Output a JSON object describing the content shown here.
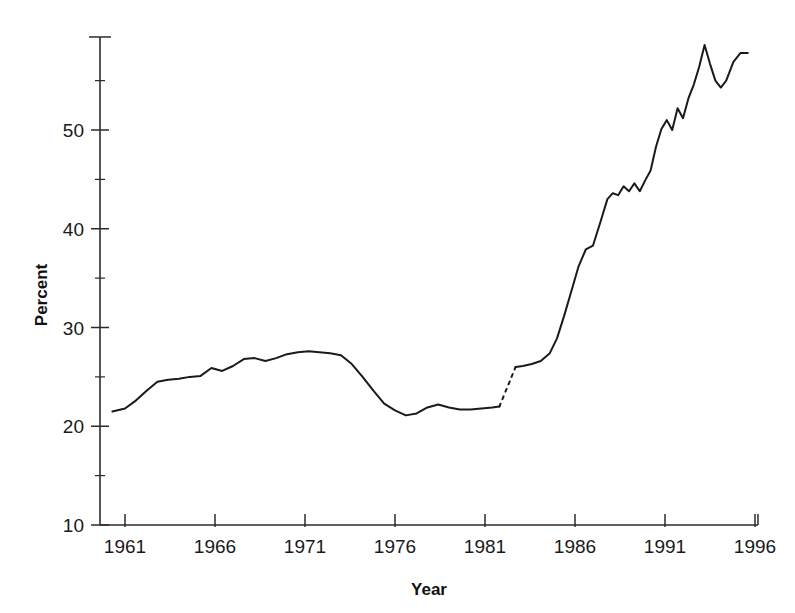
{
  "chart_data": {
    "type": "line",
    "title": "",
    "xlabel": "Year",
    "ylabel": "Percent",
    "xlim": [
      1960,
      1996
    ],
    "ylim": [
      10,
      60
    ],
    "grid": false,
    "legend": null,
    "x_ticks": [
      1961,
      1966,
      1971,
      1976,
      1981,
      1986,
      1991,
      1996
    ],
    "x_tick_labels": [
      "1961",
      "1966",
      "1971",
      "1976",
      "1981",
      "1986",
      "1991",
      "1996"
    ],
    "y_ticks": [
      10,
      20,
      30,
      40,
      50
    ],
    "y_tick_labels": [
      "10",
      "20",
      "30",
      "40",
      "50"
    ],
    "y_minor_ticks": [
      15,
      25,
      35,
      45,
      55
    ],
    "series": [
      {
        "name": "Percent",
        "style": "solid",
        "note": "segment before data break",
        "x": [
          1960.3,
          1961.0,
          1961.6,
          1962.2,
          1962.8,
          1963.4,
          1964.0,
          1964.6,
          1965.2,
          1965.8,
          1966.4,
          1967.0,
          1967.6,
          1968.2,
          1968.8,
          1969.4,
          1970.0,
          1970.6,
          1971.2,
          1971.8,
          1972.4,
          1973.0,
          1973.6,
          1974.2,
          1974.8,
          1975.4,
          1976.0,
          1976.6,
          1977.2,
          1977.8,
          1978.4,
          1979.0,
          1979.6,
          1980.2,
          1980.8,
          1981.4,
          1981.8
        ],
        "y": [
          21.5,
          21.8,
          22.6,
          23.6,
          24.5,
          24.7,
          24.8,
          25.0,
          25.1,
          25.9,
          25.6,
          26.1,
          26.8,
          26.9,
          26.6,
          26.9,
          27.3,
          27.5,
          27.6,
          27.5,
          27.4,
          27.2,
          26.3,
          25.0,
          23.6,
          22.3,
          21.6,
          21.1,
          21.3,
          21.9,
          22.2,
          21.9,
          21.7,
          21.7,
          21.8,
          21.9,
          22.0
        ]
      },
      {
        "name": "Percent (break)",
        "style": "dashed",
        "note": "dashed connector across data discontinuity",
        "x": [
          1981.8,
          1982.7
        ],
        "y": [
          22.0,
          26.0
        ]
      },
      {
        "name": "Percent (continued)",
        "style": "solid",
        "note": "segment after data break",
        "x": [
          1982.7,
          1983.1,
          1983.6,
          1984.1,
          1984.6,
          1985.0,
          1985.4,
          1985.8,
          1986.2,
          1986.6,
          1987.0,
          1987.4,
          1987.8,
          1988.1,
          1988.4,
          1988.7,
          1989.0,
          1989.3,
          1989.6,
          1989.9,
          1990.2,
          1990.5,
          1990.8,
          1991.1,
          1991.4,
          1991.7,
          1992.0,
          1992.3,
          1992.6,
          1992.9,
          1993.2,
          1993.5,
          1993.8,
          1994.1,
          1994.4,
          1994.8,
          1995.2,
          1995.6
        ],
        "y": [
          26.0,
          26.1,
          26.3,
          26.6,
          27.4,
          28.9,
          31.2,
          33.7,
          36.2,
          37.9,
          38.3,
          40.6,
          43.0,
          43.6,
          43.4,
          44.3,
          43.8,
          44.6,
          43.8,
          44.9,
          45.9,
          48.3,
          50.1,
          51.0,
          50.0,
          52.2,
          51.2,
          53.2,
          54.6,
          56.4,
          58.6,
          56.7,
          55.0,
          54.3,
          55.0,
          56.9,
          57.8,
          57.8
        ]
      }
    ]
  }
}
